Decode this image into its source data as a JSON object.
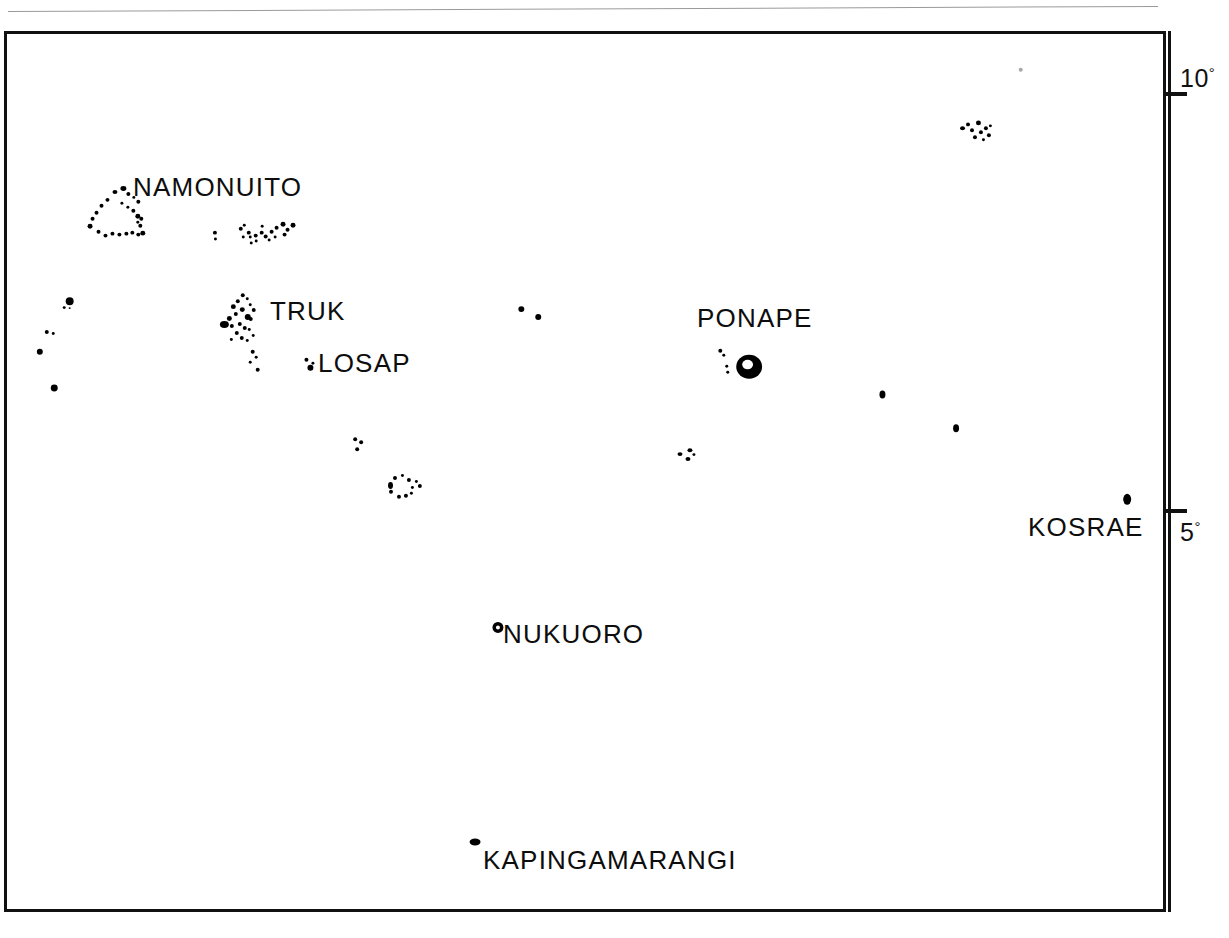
{
  "page": {
    "domain": "Map",
    "background": "#ffffff",
    "ink": "#000000",
    "width": 1229,
    "height": 938,
    "header_rule_text": ""
  },
  "map": {
    "frame": {
      "x": 4,
      "y": 31,
      "width": 1162,
      "height": 881,
      "border_px": 3,
      "border_color": "#111111"
    },
    "projection_note": "Eastern Caroline Islands, Micronesia"
  },
  "latitude_axis": {
    "axis_color": "#111111",
    "ticks": [
      {
        "id": "lat-10",
        "label": "10",
        "degree_symbol": "°",
        "y": 92,
        "label_x": 1180,
        "label_y": 64
      },
      {
        "id": "lat-5",
        "label": "5",
        "degree_symbol": "°",
        "y": 509,
        "label_x": 1180,
        "label_y": 518
      }
    ]
  },
  "labels": [
    {
      "id": "namonuito",
      "text": "NAMONUITO",
      "x": 133,
      "y": 172,
      "font_size": 26
    },
    {
      "id": "truk",
      "text": "TRUK",
      "x": 270,
      "y": 296,
      "font_size": 26
    },
    {
      "id": "losap",
      "text": "LOSAP",
      "x": 318,
      "y": 348,
      "font_size": 26
    },
    {
      "id": "ponape",
      "text": "PONAPE",
      "x": 697,
      "y": 303,
      "font_size": 26
    },
    {
      "id": "kosrae",
      "text": "KOSRAE",
      "x": 1028,
      "y": 512,
      "font_size": 26
    },
    {
      "id": "nukuoro",
      "text": "NUKUORO",
      "x": 503,
      "y": 619,
      "font_size": 26
    },
    {
      "id": "kapingamarangi",
      "text": "KAPINGAMARANGI",
      "x": 483,
      "y": 845,
      "font_size": 26
    }
  ],
  "islands": [
    {
      "name": "namonuito-atoll",
      "kind": "atoll-ring",
      "dots": [
        [
          118,
          184,
          6,
          5
        ],
        [
          110,
          188,
          5,
          4
        ],
        [
          124,
          190,
          4,
          4
        ],
        [
          130,
          194,
          3,
          3
        ],
        [
          134,
          198,
          4,
          4
        ],
        [
          103,
          196,
          4,
          4
        ],
        [
          97,
          202,
          4,
          4
        ],
        [
          118,
          200,
          3,
          3
        ],
        [
          124,
          204,
          3,
          3
        ],
        [
          129,
          207,
          4,
          4
        ],
        [
          133,
          212,
          5,
          5
        ],
        [
          92,
          209,
          4,
          4
        ],
        [
          88,
          215,
          4,
          4
        ],
        [
          85,
          222,
          5,
          5
        ],
        [
          94,
          228,
          4,
          4
        ],
        [
          101,
          232,
          4,
          4
        ],
        [
          108,
          230,
          4,
          4
        ],
        [
          115,
          231,
          4,
          4
        ],
        [
          122,
          230,
          4,
          4
        ],
        [
          128,
          229,
          4,
          4
        ],
        [
          134,
          231,
          4,
          4
        ],
        [
          138,
          229,
          5,
          5
        ],
        [
          136,
          222,
          4,
          4
        ],
        [
          137,
          215,
          4,
          4
        ],
        [
          134,
          219,
          3,
          3
        ]
      ]
    },
    {
      "name": "hall-islands-group",
      "kind": "atoll-cluster",
      "dots": [
        [
          211,
          229,
          4,
          4
        ],
        [
          212,
          236,
          3,
          3
        ],
        [
          237,
          225,
          4,
          4
        ],
        [
          241,
          222,
          3,
          3
        ],
        [
          245,
          229,
          4,
          4
        ],
        [
          240,
          234,
          3,
          3
        ],
        [
          247,
          234,
          3,
          3
        ],
        [
          252,
          232,
          4,
          4
        ],
        [
          258,
          229,
          4,
          4
        ],
        [
          253,
          238,
          3,
          3
        ],
        [
          248,
          240,
          3,
          3
        ],
        [
          262,
          233,
          4,
          4
        ],
        [
          268,
          228,
          4,
          4
        ],
        [
          273,
          224,
          4,
          4
        ],
        [
          279,
          220,
          5,
          5
        ],
        [
          284,
          226,
          4,
          4
        ],
        [
          289,
          221,
          5,
          5
        ],
        [
          281,
          231,
          4,
          4
        ],
        [
          272,
          234,
          3,
          3
        ],
        [
          266,
          237,
          3,
          3
        ],
        [
          259,
          223,
          3,
          3
        ]
      ]
    },
    {
      "name": "truk-lagoon",
      "kind": "island-cluster",
      "dots": [
        [
          239,
          292,
          4,
          4
        ],
        [
          244,
          296,
          3,
          3
        ],
        [
          234,
          298,
          4,
          4
        ],
        [
          247,
          302,
          3,
          3
        ],
        [
          229,
          303,
          5,
          5
        ],
        [
          238,
          306,
          5,
          5
        ],
        [
          250,
          307,
          4,
          4
        ],
        [
          232,
          311,
          4,
          4
        ],
        [
          243,
          313,
          6,
          6
        ],
        [
          225,
          315,
          5,
          5
        ],
        [
          247,
          316,
          4,
          4
        ],
        [
          218,
          320,
          9,
          7
        ],
        [
          236,
          321,
          4,
          4
        ],
        [
          228,
          323,
          4,
          4
        ],
        [
          241,
          325,
          4,
          4
        ],
        [
          233,
          330,
          4,
          4
        ],
        [
          246,
          327,
          3,
          3
        ],
        [
          238,
          335,
          4,
          4
        ],
        [
          228,
          337,
          3,
          3
        ],
        [
          244,
          338,
          3,
          3
        ],
        [
          250,
          333,
          3,
          3
        ],
        [
          249,
          349,
          4,
          4
        ],
        [
          253,
          355,
          3,
          3
        ],
        [
          247,
          360,
          3,
          3
        ],
        [
          254,
          367,
          4,
          4
        ]
      ]
    },
    {
      "name": "losap-atoll",
      "kind": "atoll",
      "dots": [
        [
          303,
          357,
          4,
          4
        ],
        [
          306,
          364,
          6,
          6
        ],
        [
          310,
          361,
          3,
          3
        ]
      ]
    },
    {
      "name": "west-outlier-a",
      "kind": "island",
      "dots": [
        [
          63,
          296,
          8,
          8
        ],
        [
          60,
          305,
          3,
          3
        ],
        [
          66,
          306,
          2,
          2
        ]
      ]
    },
    {
      "name": "west-outlier-b",
      "kind": "island",
      "dots": [
        [
          42,
          329,
          4,
          4
        ],
        [
          49,
          331,
          3,
          3
        ]
      ]
    },
    {
      "name": "west-outlier-c",
      "kind": "island",
      "dots": [
        [
          34,
          348,
          6,
          6
        ]
      ]
    },
    {
      "name": "west-outlier-d",
      "kind": "island",
      "dots": [
        [
          48,
          384,
          7,
          7
        ]
      ]
    },
    {
      "name": "central-outlier-pair",
      "kind": "island",
      "dots": [
        [
          518,
          305,
          6,
          6
        ],
        [
          535,
          313,
          6,
          6
        ]
      ]
    },
    {
      "name": "etal-atoll",
      "kind": "atoll",
      "dots": [
        [
          352,
          437,
          4,
          4
        ],
        [
          358,
          440,
          4,
          4
        ],
        [
          354,
          447,
          4,
          4
        ]
      ]
    },
    {
      "name": "satawan-atoll",
      "kind": "atoll-ring",
      "dots": [
        [
          392,
          476,
          4,
          4
        ],
        [
          400,
          474,
          3,
          3
        ],
        [
          406,
          478,
          4,
          4
        ],
        [
          414,
          480,
          3,
          3
        ],
        [
          387,
          482,
          5,
          7
        ],
        [
          410,
          486,
          3,
          3
        ],
        [
          417,
          484,
          4,
          4
        ],
        [
          388,
          490,
          4,
          4
        ],
        [
          396,
          495,
          4,
          4
        ],
        [
          403,
          494,
          4,
          4
        ],
        [
          409,
          492,
          3,
          3
        ]
      ]
    },
    {
      "name": "mokil-pingelap-group",
      "kind": "atoll",
      "dots": [
        [
          678,
          452,
          5,
          4
        ],
        [
          688,
          448,
          5,
          4
        ],
        [
          686,
          457,
          5,
          4
        ],
        [
          693,
          453,
          3,
          3
        ]
      ]
    },
    {
      "name": "ponape-island",
      "kind": "island-large",
      "blob": {
        "x": 737,
        "y": 354,
        "width": 26,
        "height": 24
      },
      "dots": [
        [
          719,
          348,
          4,
          4
        ],
        [
          723,
          353,
          3,
          3
        ],
        [
          726,
          364,
          3,
          3
        ],
        [
          727,
          370,
          3,
          3
        ]
      ]
    },
    {
      "name": "pakin-ant-group",
      "kind": "atoll-cluster",
      "dots": [
        [
          962,
          124,
          5,
          4
        ],
        [
          968,
          120,
          4,
          4
        ],
        [
          972,
          126,
          4,
          4
        ],
        [
          978,
          118,
          5,
          5
        ],
        [
          981,
          128,
          4,
          4
        ],
        [
          975,
          133,
          4,
          4
        ],
        [
          986,
          124,
          4,
          4
        ],
        [
          989,
          131,
          4,
          4
        ],
        [
          984,
          136,
          3,
          3
        ],
        [
          991,
          122,
          3,
          3
        ]
      ]
    },
    {
      "name": "faint-dot-north",
      "kind": "island-faint",
      "dots": [
        [
          1021,
          65,
          4,
          4
        ]
      ]
    },
    {
      "name": "east-outlier-a",
      "kind": "island",
      "dots": [
        [
          881,
          390,
          6,
          8
        ]
      ]
    },
    {
      "name": "east-outlier-b",
      "kind": "island",
      "dots": [
        [
          955,
          424,
          6,
          8
        ]
      ]
    },
    {
      "name": "kosrae-island",
      "kind": "island",
      "dots": [
        [
          1126,
          494,
          8,
          11
        ]
      ]
    },
    {
      "name": "nukuoro-atoll",
      "kind": "atoll-ring-small",
      "ring": {
        "x": 492,
        "y": 623,
        "outer": 11,
        "inner": 4
      }
    },
    {
      "name": "kapingamarangi-atoll",
      "kind": "atoll",
      "dots": [
        [
          469,
          841,
          11,
          7
        ]
      ]
    }
  ]
}
